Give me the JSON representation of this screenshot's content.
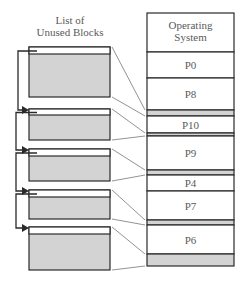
{
  "title": "List of Unused Blocks",
  "title_lines": [
    "List of",
    "Unused Blocks"
  ],
  "colors": {
    "stroke": "#2a2a2a",
    "free_fill": "#d3d3d3",
    "used_fill": "#ffffff",
    "leader_line": "#777777",
    "text": "#5a5a5a"
  },
  "memory": {
    "segments": [
      {
        "label_lines": [
          "Operating",
          "System"
        ],
        "type": "used",
        "y0": 13,
        "y1": 52
      },
      {
        "label": "P0",
        "type": "used",
        "y0": 52,
        "y1": 78
      },
      {
        "label": "P8",
        "type": "used",
        "y0": 78,
        "y1": 110
      },
      {
        "label": "",
        "type": "free",
        "y0": 110,
        "y1": 116
      },
      {
        "label": "P10",
        "type": "used",
        "y0": 116,
        "y1": 133
      },
      {
        "label": "",
        "type": "free",
        "y0": 133,
        "y1": 136
      },
      {
        "label": "P9",
        "type": "used",
        "y0": 136,
        "y1": 170
      },
      {
        "label": "",
        "type": "free",
        "y0": 170,
        "y1": 175
      },
      {
        "label": "P4",
        "type": "used",
        "y0": 175,
        "y1": 191
      },
      {
        "label": "P7",
        "type": "used",
        "y0": 191,
        "y1": 220
      },
      {
        "label": "",
        "type": "free",
        "y0": 220,
        "y1": 225
      },
      {
        "label": "P6",
        "type": "used",
        "y0": 225,
        "y1": 254
      },
      {
        "label": "",
        "type": "free",
        "y0": 254,
        "y1": 266
      }
    ]
  },
  "free_list": [
    {
      "y0": 47,
      "y1": 97,
      "header": 7,
      "maps_to": [
        110,
        116
      ]
    },
    {
      "y0": 109,
      "y1": 140,
      "header": 6,
      "maps_to": [
        133,
        136
      ]
    },
    {
      "y0": 149,
      "y1": 181,
      "header": 7,
      "maps_to": [
        170,
        175
      ]
    },
    {
      "y0": 190,
      "y1": 219,
      "header": 7,
      "maps_to": [
        220,
        225
      ]
    },
    {
      "y0": 227,
      "y1": 270,
      "header": 7,
      "maps_to": [
        254,
        266
      ]
    }
  ]
}
